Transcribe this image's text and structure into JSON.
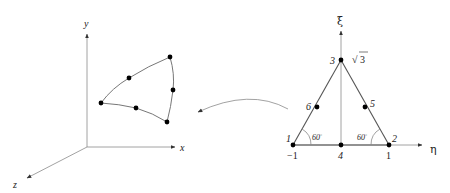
{
  "left_panel": {
    "axes": {
      "x_label": "x",
      "y_label": "y",
      "z_label": "z"
    },
    "element_description": "curved 6-node triangular element in physical space"
  },
  "right_panel": {
    "axes": {
      "horizontal_label": "η",
      "vertical_label": "ξ"
    },
    "nodes": [
      {
        "id": "1",
        "label": "1"
      },
      {
        "id": "2",
        "label": "2"
      },
      {
        "id": "3",
        "label": "3"
      },
      {
        "id": "4",
        "label": "4"
      },
      {
        "id": "5",
        "label": "5"
      },
      {
        "id": "6",
        "label": "6"
      }
    ],
    "ticks": {
      "left": "−1",
      "right": "1",
      "apex": "√3",
      "apex_radicand": "3",
      "apex_radical": "√"
    },
    "angles": {
      "left": "60",
      "right": "60",
      "degree": "°"
    }
  },
  "connector": {
    "description": "curved mapping arrow from reference element to physical element"
  }
}
